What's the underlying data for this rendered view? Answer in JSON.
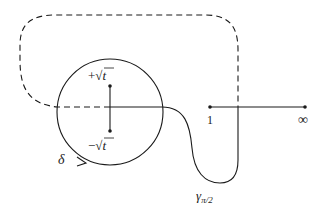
{
  "diagram": {
    "stroke_color": "#1a1a1a",
    "background": "#ffffff",
    "points": {
      "plus_sqrt_t": {
        "label_sign": "+",
        "label_root": "√",
        "label_var": "t",
        "x": 110,
        "y": 86
      },
      "minus_sqrt_t": {
        "label_sign": "−",
        "label_root": "√",
        "label_var": "t",
        "x": 110,
        "y": 131
      },
      "one": {
        "label": "1",
        "x": 210,
        "y": 107
      },
      "infinity": {
        "label": "∞",
        "x": 305,
        "y": 107
      }
    },
    "circle": {
      "label": "δ",
      "cx": 110,
      "cy": 112,
      "r": 53,
      "orientation": "counterclockwise arrow at bottom-left"
    },
    "paths": {
      "gamma": {
        "label_main": "γ",
        "label_sub": "π/2",
        "style": "solid"
      },
      "return": {
        "style": "dashed"
      },
      "branch_cut": {
        "from": "1",
        "to": "∞",
        "style": "solid"
      }
    }
  }
}
